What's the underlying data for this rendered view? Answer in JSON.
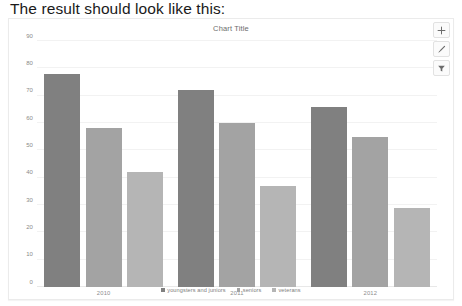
{
  "heading": "The result should look like this:",
  "panel": {
    "title": "Chart Title",
    "toolbar": [
      {
        "name": "add-button",
        "icon": "plus-icon",
        "label": "+"
      },
      {
        "name": "format-button",
        "icon": "brush-icon",
        "label": "Format"
      },
      {
        "name": "filter-button",
        "icon": "filter-icon",
        "label": "Filter"
      }
    ]
  },
  "chart_data": {
    "type": "bar",
    "title": "Chart Title",
    "xlabel": "",
    "ylabel": "",
    "categories": [
      "2010",
      "2011",
      "2012"
    ],
    "series": [
      {
        "name": "youngsters and juniors",
        "color": "#808080",
        "values": [
          78,
          72,
          66
        ]
      },
      {
        "name": "seniors",
        "color": "#a3a3a3",
        "values": [
          58,
          60,
          55
        ]
      },
      {
        "name": "veterans",
        "color": "#b5b5b5",
        "values": [
          42,
          37,
          29
        ]
      }
    ],
    "ylim": [
      0,
      90
    ],
    "yticks": [
      0,
      10,
      20,
      30,
      40,
      50,
      60,
      70,
      80,
      90
    ],
    "ytick_labels": [
      "0",
      "10",
      "20",
      "30",
      "40",
      "50",
      "60",
      "70",
      "80",
      "90"
    ],
    "grid": true,
    "legend_position": "bottom"
  }
}
